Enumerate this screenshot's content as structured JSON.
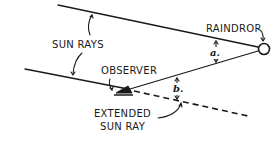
{
  "diagram": {
    "labels": {
      "sun_rays": "SUN RAYS",
      "raindrop": "RAINDROP",
      "observer": "OBSERVER",
      "extended_line1": "EXTENDED",
      "extended_line2": "SUN RAY",
      "angle_a": "a.",
      "angle_b": "b."
    },
    "colors": {
      "ink": "#1a1a1a",
      "background": "#ffffff"
    }
  }
}
